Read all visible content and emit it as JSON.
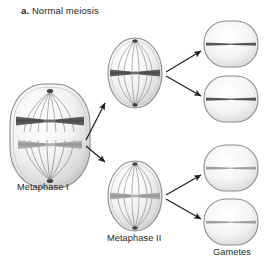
{
  "figure": {
    "panel_tag": "a.",
    "panel_title": "Normal meiosis",
    "type": "biology-process-diagram",
    "background_color": "#ffffff"
  },
  "labels": {
    "metaphase_1": "Metaphase I",
    "metaphase_2": "Metaphase II",
    "gametes": "Gametes"
  },
  "colors": {
    "chromosome_dark": "#58585b",
    "chromosome_light": "#a7a9ac",
    "cell_outline": "#808285",
    "spindle_fiber": "#6d6e71",
    "arrow": "#231f20",
    "text": "#231f20"
  },
  "stages": [
    {
      "id": "metaphase-1",
      "label": "Metaphase I",
      "shape": "rounded-rectangle",
      "cx": 50,
      "cy": 136,
      "rx": 40,
      "ry": 52,
      "chromosomes": [
        {
          "id": "chrom-dark-pair",
          "color_key": "chromosome_dark",
          "form": "x-shaped-bivalent",
          "y": 121
        },
        {
          "id": "chrom-light-pair",
          "color_key": "chromosome_light",
          "form": "x-shaped-bivalent",
          "y": 145
        }
      ],
      "spindle": true
    },
    {
      "id": "metaphase-2-upper",
      "label": "Metaphase II",
      "shape": "oval",
      "cx": 135,
      "cy": 73,
      "rx": 27,
      "ry": 35,
      "chromosomes": [
        {
          "id": "chrom-dark",
          "color_key": "chromosome_dark",
          "form": "x-shaped",
          "y": 73
        }
      ],
      "spindle": true
    },
    {
      "id": "metaphase-2-lower",
      "label": "Metaphase II",
      "shape": "oval",
      "cx": 135,
      "cy": 196,
      "rx": 27,
      "ry": 35,
      "chromosomes": [
        {
          "id": "chrom-light",
          "color_key": "chromosome_light",
          "form": "x-shaped",
          "y": 196
        }
      ],
      "spindle": true
    }
  ],
  "gametes": [
    {
      "id": "gamete-1",
      "cx": 231,
      "cy": 44,
      "rx": 27,
      "ry": 23,
      "color_key": "chromosome_dark"
    },
    {
      "id": "gamete-2",
      "cx": 231,
      "cy": 99,
      "rx": 27,
      "ry": 23,
      "color_key": "chromosome_dark"
    },
    {
      "id": "gamete-3",
      "cx": 231,
      "cy": 168,
      "rx": 27,
      "ry": 23,
      "color_key": "chromosome_light"
    },
    {
      "id": "gamete-4",
      "cx": 231,
      "cy": 222,
      "rx": 27,
      "ry": 23,
      "color_key": "chromosome_light"
    }
  ],
  "arrows": [
    {
      "id": "arrow-m1-to-m2-upper",
      "from": "metaphase-1",
      "to": "metaphase-2-upper",
      "x1": 86,
      "y1": 140,
      "x2": 106,
      "y2": 104
    },
    {
      "id": "arrow-m1-to-m2-lower",
      "from": "metaphase-1",
      "to": "metaphase-2-lower",
      "x1": 86,
      "y1": 146,
      "x2": 106,
      "y2": 161
    },
    {
      "id": "arrow-m2upper-to-gamete-1",
      "from": "metaphase-2-upper",
      "to": "gamete-1",
      "x1": 166,
      "y1": 72,
      "x2": 202,
      "y2": 50
    },
    {
      "id": "arrow-m2upper-to-gamete-2",
      "from": "metaphase-2-upper",
      "to": "gamete-2",
      "x1": 166,
      "y1": 76,
      "x2": 202,
      "y2": 97
    },
    {
      "id": "arrow-m2lower-to-gamete-3",
      "from": "metaphase-2-lower",
      "to": "gamete-3",
      "x1": 166,
      "y1": 195,
      "x2": 202,
      "y2": 174
    },
    {
      "id": "arrow-m2lower-to-gamete-4",
      "from": "metaphase-2-lower",
      "to": "gamete-4",
      "x1": 166,
      "y1": 199,
      "x2": 202,
      "y2": 220
    }
  ]
}
